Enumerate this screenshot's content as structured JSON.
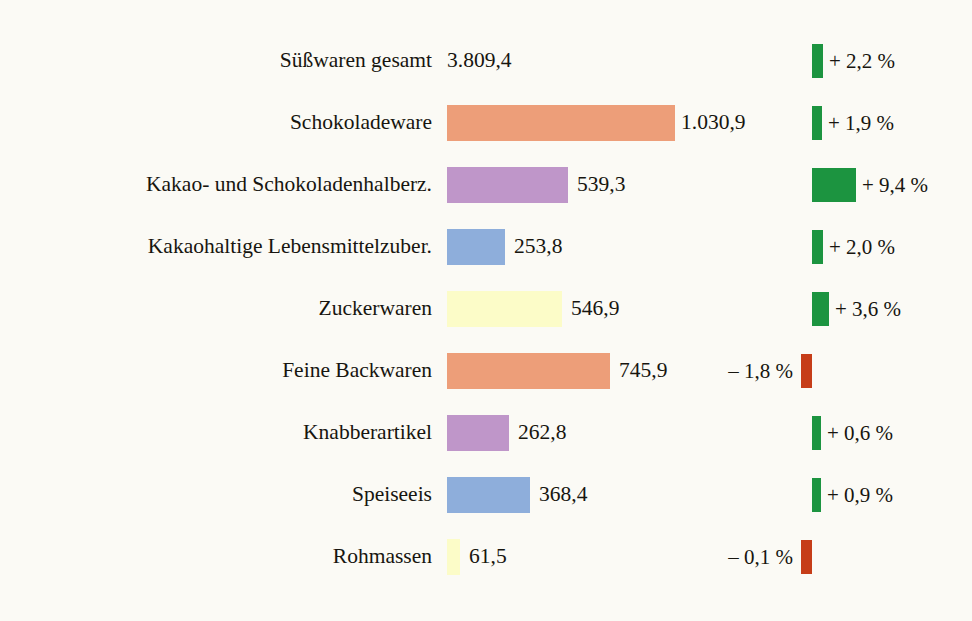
{
  "title": "",
  "colors": {
    "background": "#fbfaf5",
    "text": "#17150f",
    "orange": "#ed9e79",
    "purple": "#bf96c9",
    "blue": "#8eaedb",
    "yellow": "#fcfcc8",
    "green": "#1c9440",
    "red": "#c63d18"
  },
  "chart_data": {
    "type": "bar",
    "title": "",
    "xlabel": "",
    "ylabel": "",
    "orientation": "horizontal",
    "grid": false,
    "legend": false,
    "value_unit": "Mio. EUR",
    "change_unit": "%",
    "categories": [
      "Süßwaren gesamt",
      "Schokoladeware",
      "Kakao- und Schokoladenhalberz.",
      "Kakaohaltige Lebensmittelzuber.",
      "Zuckerwaren",
      "Feine Backwaren",
      "Knabberartikel",
      "Speiseeis",
      "Rohmassen"
    ],
    "values": [
      3809.4,
      1030.9,
      539.3,
      253.8,
      546.9,
      745.9,
      262.8,
      368.4,
      61.5
    ],
    "value_labels": [
      "3.809,4",
      "1.030,9",
      "539,3",
      "253,8",
      "546,9",
      "745,9",
      "262,8",
      "368,4",
      "61,5"
    ],
    "changes": [
      2.2,
      1.9,
      9.4,
      2.0,
      3.6,
      -1.8,
      0.6,
      0.9,
      -0.1
    ],
    "change_labels": [
      "+ 2,2 %",
      "+ 1,9 %",
      "+ 9,4 %",
      "+ 2,0 %",
      "+ 3,6 %",
      "– 1,8 %",
      "+ 0,6 %",
      "+ 0,9 %",
      "– 0,1 %"
    ]
  },
  "rows": [
    {
      "label": "Süßwaren gesamt",
      "value_label": "3.809,4",
      "bar_color": "none",
      "bar_width": 0,
      "value_offset": 0,
      "change_label": "+ 2,2 %",
      "change_positive": true,
      "change_bar_width": 11,
      "change_bar_color": "#1c9440"
    },
    {
      "label": "Schokoladeware",
      "value_label": "1.030,9",
      "bar_color": "#ed9e79",
      "bar_width": 228,
      "value_offset": 234,
      "change_label": "+ 1,9 %",
      "change_positive": true,
      "change_bar_width": 10,
      "change_bar_color": "#1c9440"
    },
    {
      "label": "Kakao- und Schokoladenhalberz.",
      "value_label": "539,3",
      "bar_color": "#bf96c9",
      "bar_width": 121,
      "value_offset": 130,
      "change_label": "+ 9,4 %",
      "change_positive": true,
      "change_bar_width": 44,
      "change_bar_color": "#1c9440"
    },
    {
      "label": "Kakaohaltige Lebensmittelzuber.",
      "value_label": "253,8",
      "bar_color": "#8eaedb",
      "bar_width": 58,
      "value_offset": 67,
      "change_label": "+ 2,0 %",
      "change_positive": true,
      "change_bar_width": 11,
      "change_bar_color": "#1c9440"
    },
    {
      "label": "Zuckerwaren",
      "value_label": "546,9",
      "bar_color": "#fcfcc8",
      "bar_width": 115,
      "value_offset": 124,
      "change_label": "+ 3,6 %",
      "change_positive": true,
      "change_bar_width": 17,
      "change_bar_color": "#1c9440"
    },
    {
      "label": "Feine Backwaren",
      "value_label": "745,9",
      "bar_color": "#ed9e79",
      "bar_width": 163,
      "value_offset": 172,
      "change_label": "– 1,8 %",
      "change_positive": false,
      "change_bar_width": 11,
      "change_bar_color": "#c63d18"
    },
    {
      "label": "Knabberartikel",
      "value_label": "262,8",
      "bar_color": "#bf96c9",
      "bar_width": 62,
      "value_offset": 71,
      "change_label": "+ 0,6 %",
      "change_positive": true,
      "change_bar_width": 9,
      "change_bar_color": "#1c9440"
    },
    {
      "label": "Speiseeis",
      "value_label": "368,4",
      "bar_color": "#8eaedb",
      "bar_width": 83,
      "value_offset": 92,
      "change_label": "+ 0,9 %",
      "change_positive": true,
      "change_bar_width": 9,
      "change_bar_color": "#1c9440"
    },
    {
      "label": "Rohmassen",
      "value_label": "61,5",
      "bar_color": "#fcfcc8",
      "bar_width": 13,
      "value_offset": 22,
      "change_label": "– 0,1 %",
      "change_positive": false,
      "change_bar_width": 11,
      "change_bar_color": "#c63d18"
    }
  ]
}
